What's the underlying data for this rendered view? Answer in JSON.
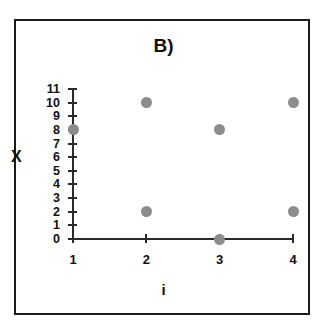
{
  "chart_data": {
    "type": "scatter",
    "title": "B)",
    "xlabel": "i",
    "ylabel": "X",
    "x": [
      1,
      2,
      2,
      3,
      3,
      4,
      4
    ],
    "y": [
      8,
      10,
      2,
      8,
      0,
      10,
      2
    ],
    "points": [
      {
        "i": 1,
        "X": 8
      },
      {
        "i": 2,
        "X": 10
      },
      {
        "i": 2,
        "X": 2
      },
      {
        "i": 3,
        "X": 8
      },
      {
        "i": 3,
        "X": 0
      },
      {
        "i": 4,
        "X": 10
      },
      {
        "i": 4,
        "X": 2
      }
    ],
    "xlim": [
      1,
      4
    ],
    "ylim": [
      0,
      11
    ],
    "xticks": [
      1,
      2,
      3,
      4
    ],
    "yticks": [
      0,
      1,
      2,
      3,
      4,
      5,
      6,
      7,
      8,
      9,
      10,
      11
    ],
    "xtick_labels": [
      "1",
      "2",
      "3",
      "4"
    ],
    "ytick_labels": [
      "0",
      "1",
      "2",
      "3",
      "4",
      "5",
      "6",
      "7",
      "8",
      "9",
      "10",
      "11"
    ],
    "grid": false,
    "legend": null,
    "marker_color": "#8c8c8c",
    "axis_color": "#2a2a2a",
    "frame_color": "#1a1a1a",
    "background_color": "#ffffff"
  },
  "layout": {
    "x_pixel": {
      "1": 73,
      "2": 146.5,
      "3": 220,
      "4": 293
    },
    "y_pixel": {
      "0": 239,
      "11": 89
    },
    "y_step": 13.636
  }
}
